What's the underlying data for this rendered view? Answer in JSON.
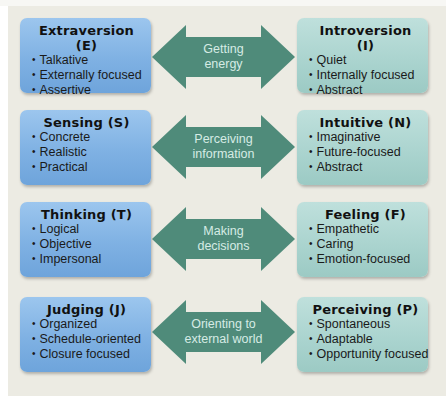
{
  "diagram": {
    "colors": {
      "left_box": "#7fb1e3",
      "right_box": "#a9d3ce",
      "arrow": "#4f8b7a",
      "arrow_text": "#d6ebe5",
      "background": "#ecebe3"
    },
    "rows": [
      {
        "left": {
          "title": "Extraversion (E)",
          "items": [
            "Talkative",
            "Externally focused",
            "Assertive"
          ]
        },
        "arrow": {
          "line1": "Getting",
          "line2": "energy"
        },
        "right": {
          "title": "Introversion (I)",
          "items": [
            "Quiet",
            "Internally focused",
            "Abstract"
          ]
        }
      },
      {
        "left": {
          "title": "Sensing (S)",
          "items": [
            "Concrete",
            "Realistic",
            "Practical"
          ]
        },
        "arrow": {
          "line1": "Perceiving",
          "line2": "information"
        },
        "right": {
          "title": "Intuitive (N)",
          "items": [
            "Imaginative",
            "Future-focused",
            "Abstract"
          ]
        }
      },
      {
        "left": {
          "title": "Thinking (T)",
          "items": [
            "Logical",
            "Objective",
            "Impersonal"
          ]
        },
        "arrow": {
          "line1": "Making",
          "line2": "decisions"
        },
        "right": {
          "title": "Feeling (F)",
          "items": [
            "Empathetic",
            "Caring",
            "Emotion-focused"
          ]
        }
      },
      {
        "left": {
          "title": "Judging (J)",
          "items": [
            "Organized",
            "Schedule-oriented",
            "Closure focused"
          ]
        },
        "arrow": {
          "line1": "Orienting to",
          "line2": "external world"
        },
        "right": {
          "title": "Perceiving (P)",
          "items": [
            "Spontaneous",
            "Adaptable",
            "Opportunity focused"
          ]
        }
      }
    ]
  }
}
